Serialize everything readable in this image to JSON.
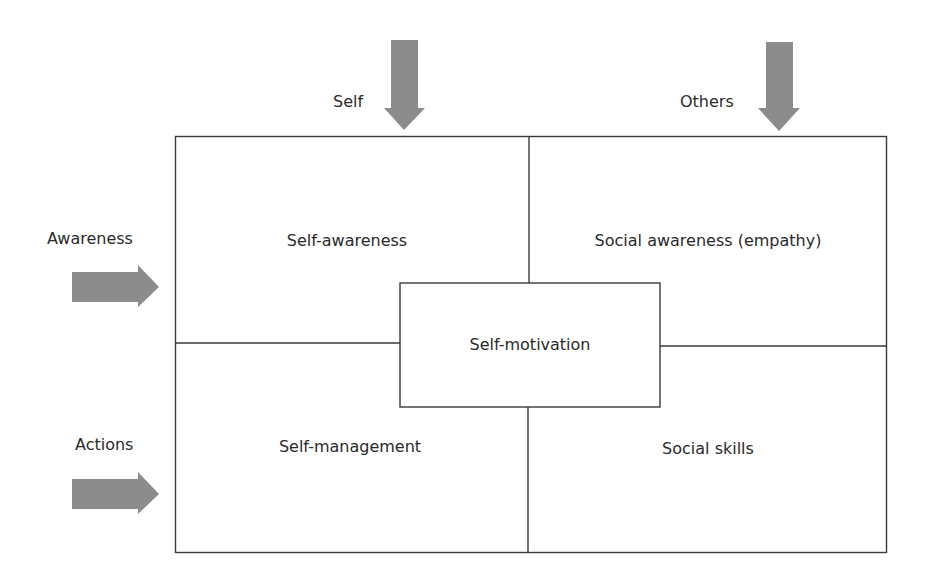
{
  "diagram": {
    "columns": [
      {
        "label": "Self"
      },
      {
        "label": "Others"
      }
    ],
    "rows": [
      {
        "label": "Awareness"
      },
      {
        "label": "Actions"
      }
    ],
    "quadrants": {
      "top_left": "Self-awareness",
      "top_right": "Social awareness (empathy)",
      "bottom_left": "Self-management",
      "bottom_right": "Social skills"
    },
    "center": "Self-motivation",
    "colors": {
      "line": "#3a3a3a",
      "arrow": "#8c8c8c",
      "text": "#2a2a2a"
    }
  }
}
